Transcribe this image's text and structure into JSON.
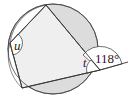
{
  "diagram": {
    "type": "cyclic-quadrilateral",
    "labels": {
      "angle_u": "u",
      "angle_t": "t",
      "exterior_angle": "118°"
    },
    "colors": {
      "fill_shaded": "#dcdcdc",
      "fill_quad": "#eeeeee",
      "stroke": "#333333",
      "background": "#ffffff"
    }
  }
}
